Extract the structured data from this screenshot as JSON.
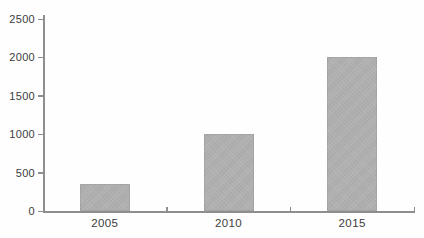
{
  "chart_data": {
    "type": "bar",
    "title": "",
    "xlabel": "",
    "ylabel": "",
    "categories": [
      "2005",
      "2010",
      "2015"
    ],
    "values": [
      350,
      1000,
      2000
    ],
    "ylim": [
      0,
      2500
    ],
    "yticks": [
      0,
      500,
      1000,
      1500,
      2000,
      2500
    ],
    "grid": false,
    "legend": null,
    "colors": {
      "bar_fill": "#b2b2b2",
      "axis": "#8e8e8e",
      "text": "#3c3c3c",
      "background": "#fefefe"
    }
  }
}
